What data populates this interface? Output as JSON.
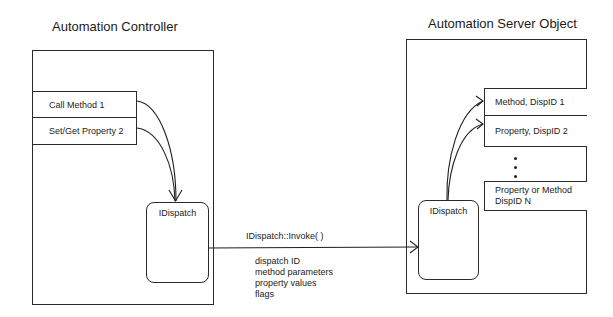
{
  "controller": {
    "title": "Automation Controller",
    "rows": [
      "Call Method 1",
      "Set/Get Property 2"
    ],
    "interface": "IDispatch"
  },
  "call": {
    "label": "IDispatch::Invoke( )",
    "params": [
      "dispatch ID",
      "method parameters",
      "property values",
      "flags"
    ]
  },
  "server": {
    "title": "Automation Server Object",
    "interface": "IDispatch",
    "rows": [
      "Method, DispID 1",
      "Property, DispID 2"
    ],
    "last_row": [
      "Property or Method",
      "DispID N"
    ],
    "ellipsis": "⋮"
  }
}
